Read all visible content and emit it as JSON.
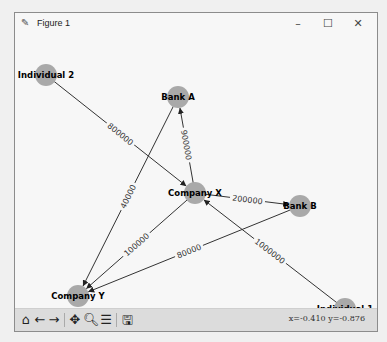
{
  "window": {
    "title": "Figure 1",
    "controls": {
      "minimize": "–",
      "maximize": "☐",
      "close": "✕"
    }
  },
  "graph": {
    "node_color": "#a9a9a9",
    "edge_color": "#333333",
    "nodes": [
      {
        "id": "Individual 2",
        "x": 31,
        "y": 40
      },
      {
        "id": "Bank A",
        "x": 163,
        "y": 62
      },
      {
        "id": "Company X",
        "x": 180,
        "y": 158
      },
      {
        "id": "Bank B",
        "x": 285,
        "y": 171
      },
      {
        "id": "Company Y",
        "x": 63,
        "y": 261
      },
      {
        "id": "Individual 1",
        "x": 330,
        "y": 274
      }
    ],
    "edges": [
      {
        "from": "Individual 2",
        "to": "Company X",
        "label": "800000"
      },
      {
        "from": "Company X",
        "to": "Bank A",
        "label": "900000"
      },
      {
        "from": "Company X",
        "to": "Bank B",
        "label": "200000"
      },
      {
        "from": "Company X",
        "to": "Company Y",
        "label": "100000"
      },
      {
        "from": "Bank A",
        "to": "Company Y",
        "label": "40000"
      },
      {
        "from": "Bank B",
        "to": "Company Y",
        "label": "80000"
      },
      {
        "from": "Individual 1",
        "to": "Company X",
        "label": "1000000"
      }
    ]
  },
  "toolbar": {
    "home": "home-icon",
    "back": "back-arrow-icon",
    "forward": "forward-arrow-icon",
    "pan": "pan-icon",
    "zoom": "zoom-icon",
    "configure": "configure-subplots-icon",
    "save": "save-icon",
    "coords": "x=-0.410 y=-0.876"
  }
}
